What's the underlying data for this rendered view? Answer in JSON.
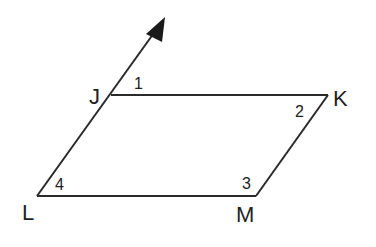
{
  "figure": {
    "shape": "parallelogram",
    "vertices": [
      {
        "label": "J",
        "x": 111,
        "y": 95
      },
      {
        "label": "K",
        "x": 328,
        "y": 95
      },
      {
        "label": "M",
        "x": 256,
        "y": 196
      },
      {
        "label": "L",
        "x": 37,
        "y": 196
      }
    ],
    "ray": {
      "from": "L",
      "through": "J",
      "arrow_tip": {
        "x": 165,
        "y": 18
      }
    },
    "angles": [
      {
        "label": "1",
        "location": "at J, between ray extension and JK"
      },
      {
        "label": "2",
        "location": "at K, interior"
      },
      {
        "label": "3",
        "location": "at M, interior"
      },
      {
        "label": "4",
        "location": "at L, interior"
      }
    ],
    "stroke_color": "#2a2a2a"
  },
  "labels": {
    "J": "J",
    "K": "K",
    "L": "L",
    "M": "M",
    "a1": "1",
    "a2": "2",
    "a3": "3",
    "a4": "4"
  }
}
